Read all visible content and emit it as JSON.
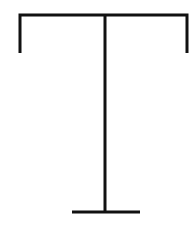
{
  "canvas": {
    "width": 195,
    "height": 225,
    "background_color": "#ffffff"
  },
  "figure": {
    "stroke_color": "#111111",
    "stroke_width": 3
  },
  "chart_data": {
    "type": "line",
    "xlabel": "",
    "ylabel": "",
    "xlim": [
      0,
      195
    ],
    "ylim": [
      0,
      225
    ],
    "grid": false,
    "legend": "none",
    "series": [
      {
        "name": "top-bracket",
        "points": [
          [
            20,
            53
          ],
          [
            20,
            15
          ],
          [
            187,
            15
          ],
          [
            187,
            53
          ]
        ]
      },
      {
        "name": "central-stem",
        "points": [
          [
            105,
            15
          ],
          [
            105,
            213
          ]
        ]
      },
      {
        "name": "base-bar",
        "points": [
          [
            72,
            212
          ],
          [
            140,
            212
          ]
        ]
      }
    ]
  }
}
